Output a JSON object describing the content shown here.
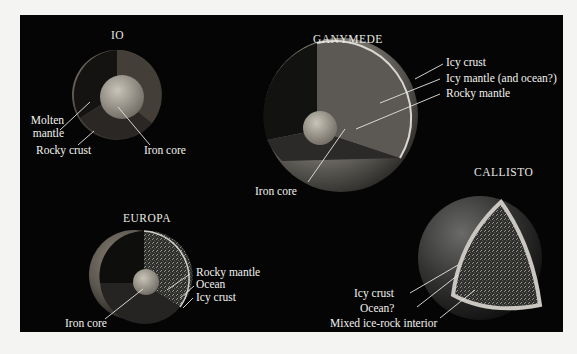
{
  "figure": {
    "background_color": "#050505",
    "label_color": "#f2f2ee"
  },
  "moons": {
    "io": {
      "name": "IO",
      "layers": {
        "mantle": "Molten\nmantle",
        "mantle_line1": "Molten",
        "mantle_line2": "mantle",
        "crust": "Rocky crust",
        "core": "Iron core"
      }
    },
    "ganymede": {
      "name": "GANYMEDE",
      "layers": {
        "crust": "Icy crust",
        "icy_mantle": "Icy mantle (and ocean?)",
        "rocky_mantle": "Rocky mantle",
        "core": "Iron core"
      }
    },
    "europa": {
      "name": "EUROPA",
      "layers": {
        "rocky_mantle": "Rocky mantle",
        "ocean": "Ocean",
        "crust": "Icy crust",
        "core": "Iron core"
      }
    },
    "callisto": {
      "name": "CALLISTO",
      "layers": {
        "crust": "Icy crust",
        "ocean": "Ocean?",
        "interior": "Mixed ice-rock interior"
      }
    }
  }
}
